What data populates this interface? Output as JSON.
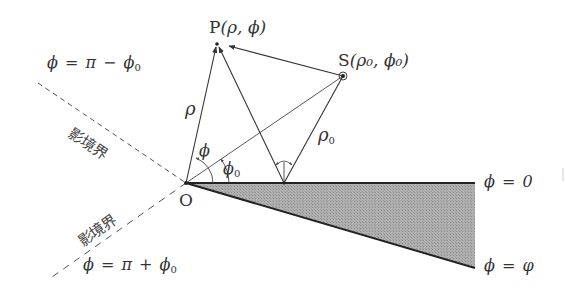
{
  "figure": {
    "type": "wedge diffraction geometry",
    "points": {
      "origin": {
        "label": "O",
        "x": 186,
        "y": 183
      },
      "observer": {
        "label": "P",
        "coords": "(ρ, ϕ)",
        "x": 217,
        "y": 44
      },
      "source": {
        "label": "S",
        "coords": "(ρ₀, ϕ₀)",
        "x": 343,
        "y": 76
      },
      "reflection_point": {
        "x": 284,
        "y": 183
      }
    },
    "labels": {
      "P_name": "P",
      "P_coords": "(ρ, ϕ)",
      "S_name": "S",
      "S_coords": "(ρ₀, ϕ₀)",
      "O_name": "O",
      "rho": "ρ",
      "rho0": "ρ",
      "rho0_sub": "0",
      "phi_angle": "ϕ",
      "phi0_angle": "ϕ",
      "phi0_sub": "0",
      "upper_boundary_eq": "ϕ = π − ϕ",
      "upper_boundary_sub": "0",
      "lower_boundary_eq": "ϕ = π + ϕ",
      "lower_boundary_sub": "0",
      "wedge_top_eq": "ϕ = 0",
      "wedge_bottom_eq": "ϕ = φ",
      "shadow_boundary_upper": "影境界",
      "shadow_boundary_lower": "影境界"
    },
    "colors": {
      "line": "#333333",
      "wedge_fill": "#a8a8a8",
      "dashed": "#555555",
      "text": "#333333"
    }
  }
}
